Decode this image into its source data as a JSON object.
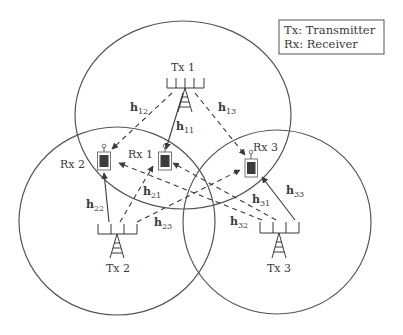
{
  "legend": {
    "line1": "Tx: Transmitter",
    "line2": "Rx: Receiver"
  },
  "transmitters": [
    {
      "label": "Tx 1"
    },
    {
      "label": "Tx 2"
    },
    {
      "label": "Tx 3"
    }
  ],
  "receivers": [
    {
      "label": "Rx 1"
    },
    {
      "label": "Rx 2"
    },
    {
      "label": "Rx 3"
    }
  ],
  "channels": {
    "h11": {
      "base": "h",
      "sub": "11",
      "style": "solid"
    },
    "h12": {
      "base": "h",
      "sub": "12",
      "style": "dashed"
    },
    "h13": {
      "base": "h",
      "sub": "13",
      "style": "dashed"
    },
    "h21": {
      "base": "h",
      "sub": "21",
      "style": "dashed"
    },
    "h22": {
      "base": "h",
      "sub": "22",
      "style": "solid"
    },
    "h23": {
      "base": "h",
      "sub": "23",
      "style": "dashed"
    },
    "h31": {
      "base": "h",
      "sub": "31",
      "style": "dashed"
    },
    "h32": {
      "base": "h",
      "sub": "32",
      "style": "dashed"
    },
    "h33": {
      "base": "h",
      "sub": "33",
      "style": "solid"
    }
  },
  "colors": {
    "line": "#4a4a4a",
    "device": "#3c3c3c",
    "text": "#3a3a3a"
  }
}
